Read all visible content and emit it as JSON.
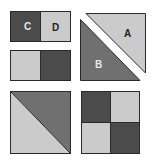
{
  "diagram": {
    "colors": {
      "dark": "#4b4b4b",
      "medium": "#707070",
      "light": "#cbcbcb",
      "outline": "#2a2a2a",
      "label_on_dark": "#e6e6e6",
      "label_on_light": "#222222"
    },
    "units": [
      {
        "id": "rect-cd",
        "type": "two-patch",
        "patches": [
          {
            "label": "C",
            "shade": "dark"
          },
          {
            "label": "D",
            "shade": "light"
          }
        ]
      },
      {
        "id": "rect-plain",
        "type": "two-patch",
        "patches": [
          {
            "label": "",
            "shade": "light"
          },
          {
            "label": "",
            "shade": "dark"
          }
        ]
      },
      {
        "id": "half-square-separated",
        "type": "half-square-triangles-separated",
        "patches": [
          {
            "label": "A",
            "shade": "light"
          },
          {
            "label": "B",
            "shade": "medium"
          }
        ]
      },
      {
        "id": "half-square-joined",
        "type": "half-square-triangle",
        "patches": [
          {
            "label": "",
            "shade": "light"
          },
          {
            "label": "",
            "shade": "medium"
          }
        ]
      },
      {
        "id": "four-patch",
        "type": "four-patch",
        "patches": [
          {
            "label": "",
            "shade": "dark"
          },
          {
            "label": "",
            "shade": "light"
          },
          {
            "label": "",
            "shade": "light"
          },
          {
            "label": "",
            "shade": "dark"
          }
        ]
      }
    ],
    "labels": {
      "c": "C",
      "d": "D",
      "a": "A",
      "b": "B"
    }
  }
}
